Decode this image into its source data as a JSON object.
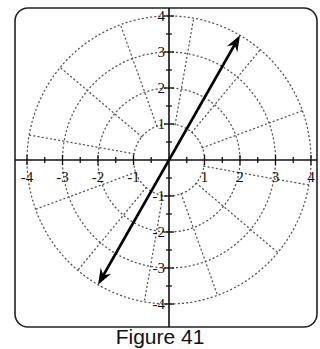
{
  "figure": {
    "caption": "Figure 41",
    "type": "polar-grid-diagram",
    "x_tick_labels": [
      "-4",
      "-3",
      "-2",
      "-1",
      "1",
      "2",
      "3",
      "4"
    ],
    "y_tick_labels": [
      "4",
      "3",
      "2",
      "1",
      "-1",
      "-2",
      "-3",
      "-4"
    ],
    "rings": [
      1,
      2,
      3,
      4
    ],
    "spoke_angles_deg": [
      20,
      50,
      80,
      110,
      140,
      170,
      200,
      230,
      260,
      290,
      320,
      350
    ],
    "line": {
      "description": "double-headed arrow through origin",
      "angle_deg": 60,
      "endpoint_1": {
        "r": 4,
        "theta_deg": 60
      },
      "endpoint_2": {
        "r": 4,
        "theta_deg": 240
      }
    },
    "colors": {
      "axis": "#111111",
      "grid": "#555555",
      "arrow": "#000000",
      "frame": "#222222"
    }
  }
}
